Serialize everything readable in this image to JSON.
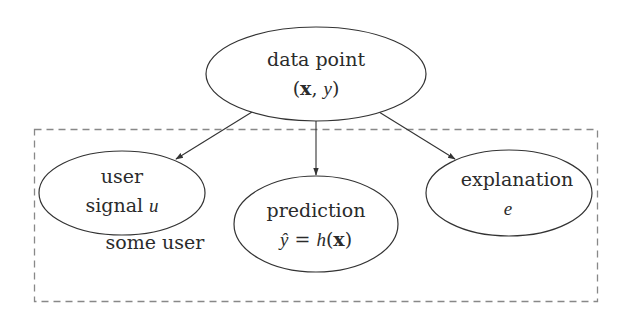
{
  "diagram": {
    "type": "directed-graph",
    "colors": {
      "edge": "#333333",
      "node_stroke": "#333333",
      "group_stroke": "#888888",
      "text": "#2b2b2b",
      "background": "#ffffff"
    },
    "nodes": {
      "data_point": {
        "line1": "data point",
        "line2_open": "(",
        "line2_x": "x",
        "line2_sep": ", ",
        "line2_y": "y",
        "line2_close": ")"
      },
      "user_signal": {
        "line1": "user",
        "line2_text": "signal ",
        "line2_var": "u"
      },
      "prediction": {
        "line1": "prediction",
        "line2_yhat": "ŷ",
        "line2_eq": " = ",
        "line2_h": "h",
        "line2_open": "(",
        "line2_x": "x",
        "line2_close": ")"
      },
      "explanation": {
        "line1": "explanation",
        "line2_var": "e"
      }
    },
    "group_label": "some user",
    "edges": [
      {
        "from": "data_point",
        "to": "user_signal"
      },
      {
        "from": "data_point",
        "to": "prediction"
      },
      {
        "from": "data_point",
        "to": "explanation"
      }
    ]
  }
}
